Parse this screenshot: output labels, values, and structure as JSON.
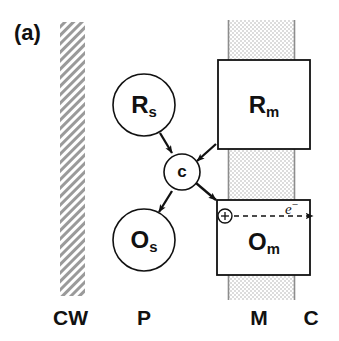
{
  "figure": {
    "panel_label": "(a)",
    "background_color": "#ffffff",
    "ink_color": "#111111"
  },
  "compartments": {
    "cell_wall": {
      "abbrev": "CW",
      "name": "cell wall",
      "fill": "diagonal-hatch",
      "hatch_color": "#9a9a9a",
      "x": 60,
      "y": 22,
      "width": 25,
      "height": 274
    },
    "periplasm": {
      "abbrev": "P",
      "name": "periplasm"
    },
    "membrane": {
      "abbrev": "M",
      "name": "membrane",
      "fill": "stipple-dots",
      "fill_color": "#e2e2e2",
      "edge_color": "#8d8d8d",
      "x": 228,
      "y": 20,
      "width": 67,
      "height": 280
    },
    "cytoplasm": {
      "abbrev": "C",
      "name": "cytoplasm"
    }
  },
  "nodes": [
    {
      "id": "Rs",
      "shape": "circle",
      "base": "R",
      "sub": "s",
      "font_size": 24,
      "cx": 144,
      "cy": 105,
      "r": 31
    },
    {
      "id": "c",
      "shape": "circle",
      "base": "c",
      "sub": "",
      "font_size": 17,
      "cx": 182,
      "cy": 172,
      "r": 18
    },
    {
      "id": "Os",
      "shape": "circle",
      "base": "O",
      "sub": "s",
      "font_size": 24,
      "cx": 144,
      "cy": 240,
      "r": 31
    },
    {
      "id": "Rm",
      "shape": "rect",
      "base": "R",
      "sub": "m",
      "font_size": 24,
      "x": 218,
      "y": 60,
      "width": 92,
      "height": 89
    },
    {
      "id": "Om",
      "shape": "rect",
      "base": "O",
      "sub": "m",
      "font_size": 24,
      "x": 217,
      "y": 200,
      "width": 93,
      "height": 75
    }
  ],
  "arrows": [
    {
      "id": "Rs-to-c",
      "from": "Rs",
      "to": "c",
      "x1": 160,
      "y1": 133,
      "x2": 172,
      "y2": 153,
      "style": "solid"
    },
    {
      "id": "c-to-Os",
      "from": "c",
      "to": "Os",
      "x1": 172,
      "y1": 191,
      "x2": 159,
      "y2": 212,
      "style": "solid"
    },
    {
      "id": "Rm-to-c",
      "from": "Rm",
      "to": "c",
      "x1": 216,
      "y1": 144,
      "x2": 196,
      "y2": 161,
      "style": "solid"
    },
    {
      "id": "c-to-Om",
      "from": "c",
      "to": "Om",
      "x1": 196,
      "y1": 183,
      "x2": 217,
      "y2": 200,
      "style": "solid"
    },
    {
      "id": "electron-transfer",
      "from": "charge",
      "to": "cytoplasm",
      "x1": 232,
      "y1": 216,
      "x2": 313,
      "y2": 216,
      "style": "dashed"
    }
  ],
  "annotations": {
    "charge_symbol": "+",
    "charge_symbol_name": "circled-plus",
    "electron_base": "e",
    "electron_sup": "−",
    "electron_text": "e−"
  },
  "axis_labels": [
    {
      "id": "CW",
      "text": "CW",
      "x": 57,
      "y": 307
    },
    {
      "id": "P",
      "text": "P",
      "x": 137,
      "y": 307
    },
    {
      "id": "M",
      "text": "M",
      "x": 246,
      "y": 307
    },
    {
      "id": "C",
      "text": "C",
      "x": 300,
      "y": 307
    }
  ]
}
